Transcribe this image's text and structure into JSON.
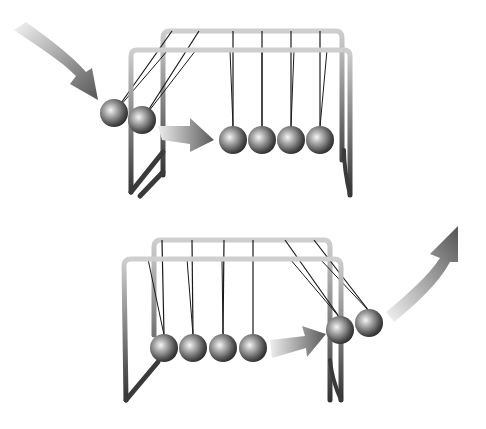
{
  "figure": {
    "panels": [
      {
        "id": "before-collision",
        "description": "Two balls swing in from the left and strike the row of four resting balls",
        "ball_count_swinging": 2,
        "ball_count_resting": 4,
        "arrows": [
          "incoming-curved-arrow",
          "transfer-arrow"
        ]
      },
      {
        "id": "after-collision",
        "description": "Four balls at rest on the left, two balls swing out on the right",
        "ball_count_swinging": 2,
        "ball_count_resting": 4,
        "arrows": [
          "transfer-arrow",
          "outgoing-curved-arrow"
        ]
      }
    ],
    "colors": {
      "background": "#ffffff",
      "frame_light": "#c8c8c8",
      "frame_dark": "#3a3a3a",
      "ball_highlight": "#f4f4f4",
      "ball_mid": "#8a8a8a",
      "ball_shadow": "#2e2e2e",
      "string": "#1a1a1a",
      "arrow_dark": "#555555",
      "arrow_light": "#f2f2f2"
    }
  }
}
